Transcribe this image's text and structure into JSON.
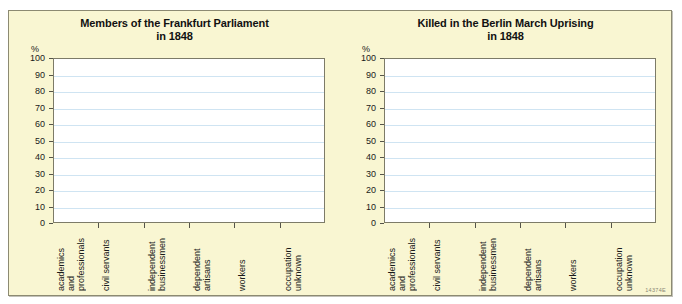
{
  "figure": {
    "id_code": "14374E",
    "top_artifact_text": "",
    "background_color": "#f9f6d2",
    "plot_background_color": "#ffffff",
    "border_color": "#8c8a72",
    "gridline_color": "#cfe4f2"
  },
  "charts": [
    {
      "title_line1": "Members of the Frankfurt Parliament",
      "title_line2": "in 1848",
      "axis_unit_label": "%"
    },
    {
      "title_line1": "Killed in the Berlin March Uprising",
      "title_line2": "in 1848",
      "axis_unit_label": "%"
    }
  ],
  "chart_data": [
    {
      "type": "bar",
      "title": "Members of the Frankfurt Parliament in 1848",
      "xlabel": "",
      "ylabel": "%",
      "ylim": [
        0,
        100
      ],
      "ytick_labels": [
        "0",
        "10",
        "20",
        "30",
        "40",
        "50",
        "60",
        "70",
        "80",
        "90",
        "100"
      ],
      "yticks": [
        0,
        10,
        20,
        30,
        40,
        50,
        60,
        70,
        80,
        90,
        100
      ],
      "grid": true,
      "legend": "none",
      "categories": [
        "academics and professionals",
        "civil servants",
        "independent businessmen",
        "dependent artisans",
        "workers",
        "occupation unknown"
      ],
      "category_lines": [
        [
          "academics",
          "and",
          "professionals"
        ],
        [
          "civil servants"
        ],
        [
          "independent",
          "businessmen"
        ],
        [
          "dependent",
          "artisans"
        ],
        [
          "workers"
        ],
        [
          "occupation",
          "unknown"
        ]
      ],
      "values": [
        null,
        null,
        null,
        null,
        null,
        null
      ],
      "note": "plot area is empty - no bars drawn"
    },
    {
      "type": "bar",
      "title": "Killed in the Berlin March Uprising in 1848",
      "xlabel": "",
      "ylabel": "%",
      "ylim": [
        0,
        100
      ],
      "ytick_labels": [
        "0",
        "10",
        "20",
        "30",
        "40",
        "50",
        "60",
        "70",
        "80",
        "90",
        "100"
      ],
      "yticks": [
        0,
        10,
        20,
        30,
        40,
        50,
        60,
        70,
        80,
        90,
        100
      ],
      "grid": true,
      "legend": "none",
      "categories": [
        "academics and professionals",
        "civil servants",
        "independent businessmen",
        "dependent artisans",
        "workers",
        "occupation unknown"
      ],
      "category_lines": [
        [
          "academics",
          "and",
          "professionals"
        ],
        [
          "civil servants"
        ],
        [
          "independent",
          "businessmen"
        ],
        [
          "dependent",
          "artisans"
        ],
        [
          "workers"
        ],
        [
          "occupation",
          "unknown"
        ]
      ],
      "values": [
        null,
        null,
        null,
        null,
        null,
        null
      ],
      "note": "plot area is empty - no bars drawn"
    }
  ]
}
